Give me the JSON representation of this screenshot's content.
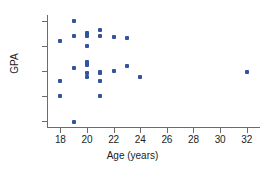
{
  "chart_data": {
    "type": "scatter",
    "title": "",
    "xlabel": "Age (years)",
    "ylabel": "GPA",
    "xlim": [
      17,
      33
    ],
    "ylim": [
      1.85,
      4.12
    ],
    "xticks": [
      18,
      20,
      22,
      24,
      26,
      28,
      30,
      32
    ],
    "xtick_labels": [
      "18",
      "20",
      "22",
      "24",
      "26",
      "28",
      "30",
      "32"
    ],
    "yticks": [
      2.0,
      2.5,
      3.0,
      3.5,
      4.0
    ],
    "ytick_labels": [
      "2.0",
      "2.5",
      "3.0",
      "3.5",
      "4.0"
    ],
    "grid": false,
    "legend": false,
    "marker_color": "#33539e",
    "axis_color": "#6b6b6b",
    "series": [
      {
        "name": "students",
        "x": [
          18,
          18,
          18,
          19,
          19,
          19,
          19,
          20,
          20,
          20,
          20,
          20,
          20,
          20,
          20,
          20,
          21,
          21,
          21,
          21,
          21,
          21,
          22,
          22,
          23,
          23,
          24,
          32
        ],
        "y": [
          3.6,
          2.79,
          2.5,
          4.0,
          3.7,
          3.05,
          1.98,
          3.75,
          3.72,
          3.7,
          3.49,
          3.18,
          3.15,
          3.12,
          2.96,
          2.88,
          3.81,
          3.7,
          2.98,
          2.95,
          2.8,
          2.5,
          3.68,
          2.99,
          3.65,
          3.09,
          2.88,
          2.98
        ]
      }
    ]
  }
}
